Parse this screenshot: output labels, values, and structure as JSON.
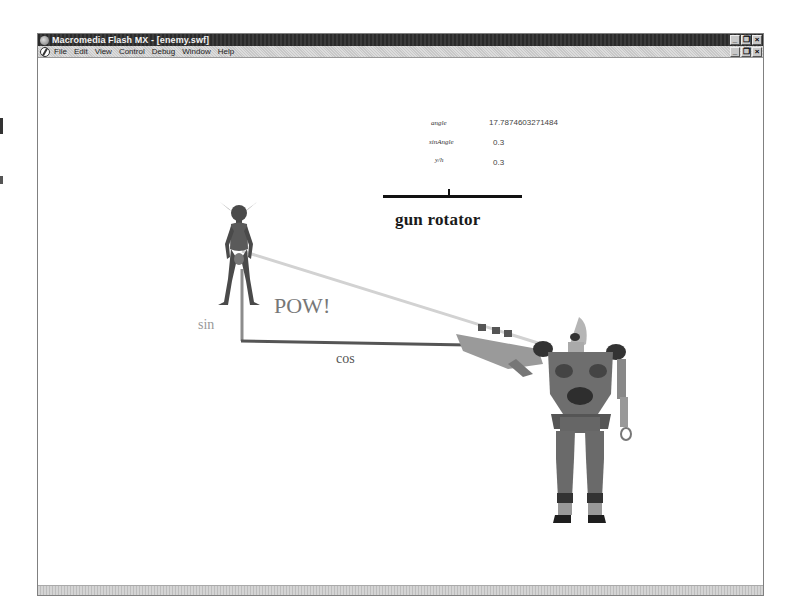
{
  "window": {
    "title": "Macromedia Flash MX - [enemy.swf]",
    "controls": [
      "minimize",
      "restore",
      "close"
    ],
    "control_glyphs": [
      "_",
      "❐",
      "×"
    ]
  },
  "menubar": {
    "items": [
      {
        "label": "File",
        "accel": "F"
      },
      {
        "label": "Edit",
        "accel": "E"
      },
      {
        "label": "View",
        "accel": "V"
      },
      {
        "label": "Control",
        "accel": "C"
      },
      {
        "label": "Debug",
        "accel": "D"
      },
      {
        "label": "Window",
        "accel": "W"
      },
      {
        "label": "Help",
        "accel": "H"
      }
    ],
    "doc_controls_glyphs": [
      "_",
      "❐",
      "×"
    ]
  },
  "stage": {
    "variables": [
      {
        "name": "angle",
        "value": "17.7874603271484"
      },
      {
        "name": "sinAngle",
        "value": "0.3"
      },
      {
        "name": "y/h",
        "value": "0.3"
      }
    ],
    "rotator": {
      "title": "gun rotator"
    },
    "labels": {
      "pow": "POW!",
      "sin": "sin",
      "cos": "cos"
    },
    "characters": {
      "enemy": "goblin-figure",
      "player": "robot-figure"
    },
    "colors": {
      "sin_line": "#8c8c8c",
      "cos_line": "#555555",
      "hypotenuse_line": "#d0d0d0",
      "rotator_bar": "#111111"
    }
  }
}
